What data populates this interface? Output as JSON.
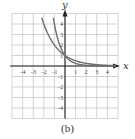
{
  "chart_data": {
    "type": "line",
    "title": "",
    "caption": "(b)",
    "xlabel": "x",
    "ylabel": "y",
    "xlim": [
      -5,
      5
    ],
    "ylim": [
      -5,
      5
    ],
    "grid": true,
    "x_ticks": [
      -4,
      -3,
      -2,
      -1,
      1,
      2,
      3,
      4
    ],
    "y_ticks": [
      -4,
      -3,
      -2,
      -1,
      1,
      2,
      3,
      4
    ],
    "series": [
      {
        "name": "y = 2^(-x)",
        "base": 0.5,
        "x": [
          -2.2,
          -2,
          -1,
          0,
          1,
          2,
          3,
          4,
          4.8
        ],
        "values": [
          4.59,
          4,
          2,
          1,
          0.5,
          0.25,
          0.125,
          0.0625,
          0.036
        ]
      },
      {
        "name": "y = 4^(-x)",
        "base": 0.25,
        "x": [
          -1.1,
          -1,
          -0.5,
          0,
          0.5,
          1,
          2,
          3,
          4.8
        ],
        "values": [
          4.59,
          4,
          2,
          1,
          0.5,
          0.25,
          0.0625,
          0.0156,
          0.001
        ]
      }
    ],
    "colors": {
      "grid": "#c8c8c8",
      "axis": "#222222",
      "curve": "#6e6e6e",
      "text": "#333333"
    }
  }
}
